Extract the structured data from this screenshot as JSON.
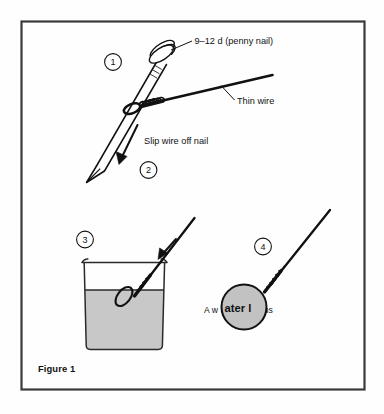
{
  "figure": {
    "caption": "Figure 1",
    "border_color": "#3a3a3a",
    "background_color": "#fefefe",
    "ink_color": "#111111",
    "water_color": "#c8c8c8",
    "lens_color": "#c2c2c2"
  },
  "steps": [
    {
      "id": "step-1",
      "number": "1"
    },
    {
      "id": "step-2",
      "number": "2"
    },
    {
      "id": "step-3",
      "number": "3"
    },
    {
      "id": "step-4",
      "number": "4"
    }
  ],
  "labels": {
    "nail_spec": "9–12 d (penny nail)",
    "thin_wire": "Thin wire",
    "slip_wire": "Slip wire off nail",
    "water_lens_before": "A w",
    "water_lens_magnified": "ater l",
    "water_lens_after": "ens",
    "water_lens_full": "A water lens"
  },
  "objects": {
    "nail": "penny nail drawn head upper-right, point lower-left",
    "wire": "thin wire coiled around nail shaft, free end to upper right",
    "beaker": "glass beaker partly filled with water",
    "loop": "wire loop dipped in water",
    "lens": "drop of water held in wire loop forming a lens"
  }
}
